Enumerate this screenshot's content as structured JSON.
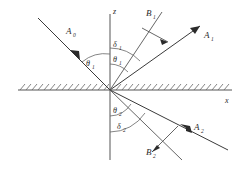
{
  "figure": {
    "type": "optics-ray-diagram",
    "background_color": "#ffffff",
    "line_color": "#3a3a3a",
    "axis_color": "#555555"
  },
  "axes": {
    "vertical": {
      "label": "z",
      "label_sub": ""
    },
    "horizontal": {
      "label": "x",
      "label_sub": ""
    },
    "origin": {
      "x": 110,
      "y": 90
    }
  },
  "interface": {
    "name": "hatched-boundary",
    "hatch_count": 34,
    "y": 90
  },
  "rays": [
    {
      "id": "incident",
      "label": "A",
      "subscript": "0",
      "label_x": 70,
      "label_y": 32,
      "quadrant": "upper-left",
      "arrow": "toward-origin"
    },
    {
      "id": "reflected-a",
      "label": "A",
      "subscript": "1",
      "label_x": 208,
      "label_y": 36,
      "quadrant": "upper-right",
      "arrow": "away-from-origin"
    },
    {
      "id": "reflected-b",
      "label": "B",
      "subscript": "1",
      "label_x": 150,
      "label_y": 15,
      "quadrant": "upper-right",
      "arrow": "perpendicular-marker"
    },
    {
      "id": "transmitted-a",
      "label": "A",
      "subscript": "2",
      "label_x": 198,
      "label_y": 128,
      "quadrant": "lower-right",
      "arrow": "away-from-origin"
    },
    {
      "id": "transmitted-b",
      "label": "B",
      "subscript": "2",
      "label_x": 152,
      "label_y": 152,
      "quadrant": "lower-right",
      "arrow": "perpendicular-marker"
    }
  ],
  "angles": [
    {
      "id": "theta-1-incident",
      "label": "θ",
      "subscript": "1",
      "label_x": 89,
      "label_y": 64,
      "region": "upper-left"
    },
    {
      "id": "theta-1-reflected",
      "label": "θ",
      "subscript": "1",
      "label_x": 114,
      "label_y": 60,
      "region": "upper-right"
    },
    {
      "id": "delta-1",
      "label": "δ",
      "subscript": "1",
      "label_x": 114,
      "label_y": 45,
      "region": "upper-right"
    },
    {
      "id": "theta-2",
      "label": "θ",
      "subscript": "2",
      "label_x": 114,
      "label_y": 111,
      "region": "lower-right"
    },
    {
      "id": "delta-2",
      "label": "δ",
      "subscript": "2",
      "label_x": 118,
      "label_y": 127,
      "region": "lower-right"
    }
  ]
}
